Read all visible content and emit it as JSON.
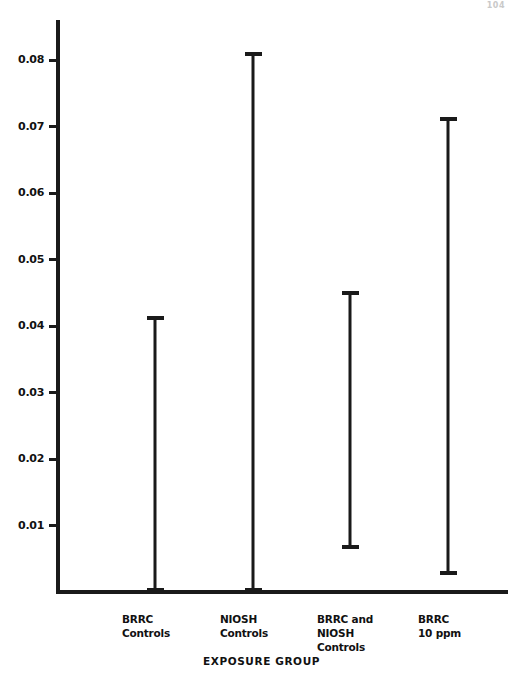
{
  "page": {
    "number": "104"
  },
  "chart_data": {
    "type": "bar",
    "subtype": "range-bar",
    "title": "",
    "xlabel": "EXPOSURE GROUP",
    "ylabel": "",
    "categories": [
      "BRRC\nControls",
      "NIOSH\nControls",
      "BRRC and\nNIOSH\nControls",
      "BRRC\n10 ppm"
    ],
    "ranges": [
      {
        "label": "BRRC Controls",
        "low": 0.0,
        "high": 0.0415
      },
      {
        "label": "NIOSH Controls",
        "low": 0.0,
        "high": 0.0812
      },
      {
        "label": "BRRC and NIOSH Controls",
        "low": 0.0065,
        "high": 0.0452
      },
      {
        "label": "BRRC 10 ppm",
        "low": 0.0025,
        "high": 0.0715
      }
    ],
    "values": [
      0.0415,
      0.0812,
      0.0452,
      0.0715
    ],
    "ylim": [
      0,
      0.0862
    ],
    "yticks": [
      0.01,
      0.02,
      0.03,
      0.04,
      0.05,
      0.06,
      0.07,
      0.08
    ],
    "ytick_labels": [
      "0.01",
      "0.02",
      "0.03",
      "0.04",
      "0.05",
      "0.06",
      "0.07",
      "0.08"
    ],
    "grid": false,
    "legend": null,
    "series_color": "#1a1a1a"
  }
}
